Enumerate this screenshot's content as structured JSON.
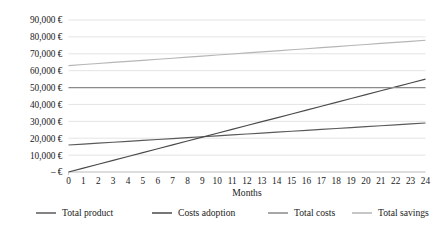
{
  "chart_data": {
    "type": "line",
    "title": "",
    "xlabel": "Months",
    "ylabel": "",
    "x": [
      0,
      1,
      2,
      3,
      4,
      5,
      6,
      7,
      8,
      9,
      10,
      11,
      12,
      13,
      14,
      15,
      16,
      17,
      18,
      19,
      20,
      21,
      22,
      23,
      24
    ],
    "xlim": [
      0,
      24
    ],
    "ylim": [
      0,
      90000
    ],
    "grid": true,
    "legend_position": "bottom",
    "x_tick_labels": [
      "0",
      "1",
      "2",
      "3",
      "4",
      "5",
      "6",
      "7",
      "8",
      "9",
      "10",
      "11",
      "12",
      "13",
      "14",
      "15",
      "16",
      "17",
      "18",
      "19",
      "20",
      "21",
      "22",
      "23",
      "24"
    ],
    "y_ticks": [
      0,
      10000,
      20000,
      30000,
      40000,
      50000,
      60000,
      70000,
      80000,
      90000
    ],
    "y_tick_labels": [
      "– €",
      "10,000 €",
      "20,000 €",
      "30,000 €",
      "40,000 €",
      "50,000 €",
      "60,000 €",
      "70,000 €",
      "80,000 €",
      "90,000 €"
    ],
    "series": [
      {
        "name": "Total product",
        "color": "#5a5a5a",
        "values": [
          16000,
          16542,
          17083,
          17625,
          18167,
          18708,
          19250,
          19792,
          20333,
          20875,
          21417,
          21958,
          22500,
          23042,
          23583,
          24125,
          24667,
          25208,
          25750,
          26292,
          26833,
          27375,
          27917,
          28458,
          29000
        ]
      },
      {
        "name": "Costs adoption",
        "color": "#4a4a4a",
        "values": [
          0,
          2292,
          4583,
          6875,
          9167,
          11458,
          13750,
          16042,
          18333,
          20625,
          22917,
          25208,
          27500,
          29792,
          32083,
          34375,
          36667,
          38958,
          41250,
          43542,
          45833,
          48125,
          50417,
          52708,
          55000
        ]
      },
      {
        "name": "Total costs",
        "color": "#8a8a8a",
        "values": [
          50000,
          50000,
          50000,
          50000,
          50000,
          50000,
          50000,
          50000,
          50000,
          50000,
          50000,
          50000,
          50000,
          50000,
          50000,
          50000,
          50000,
          50000,
          50000,
          50000,
          50000,
          50000,
          50000,
          50000,
          50000
        ]
      },
      {
        "name": "Total savings",
        "color": "#b5b5b5",
        "values": [
          63000,
          63625,
          64250,
          64875,
          65500,
          66125,
          66750,
          67375,
          68000,
          68625,
          69250,
          69875,
          70500,
          71125,
          71750,
          72375,
          73000,
          73625,
          74250,
          74875,
          75500,
          76125,
          76750,
          77375,
          78000
        ]
      }
    ]
  },
  "style": {
    "gridline_color": "#d9d9d9",
    "axis_color": "#bfbfbf",
    "background": "#ffffff",
    "text_color": "#1a1a1a"
  }
}
